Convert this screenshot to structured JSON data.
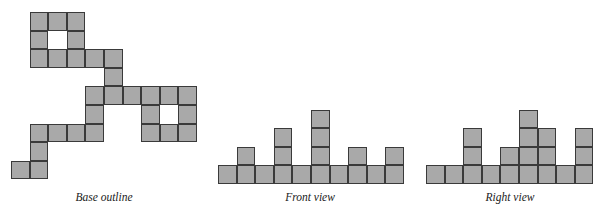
{
  "figure": {
    "cell_color": "#a9a9a9",
    "border_color": "#3a3a3a",
    "base": {
      "caption": "Base outline",
      "rows": [
        [
          1,
          2,
          3
        ],
        [
          1,
          3
        ],
        [
          1,
          2,
          3,
          4,
          5
        ],
        [
          5
        ],
        [
          4,
          5,
          6,
          7,
          8,
          9
        ],
        [
          4,
          7,
          9
        ],
        [
          1,
          2,
          3,
          4,
          7,
          8,
          9
        ],
        [
          1
        ],
        [
          0,
          1
        ]
      ]
    },
    "front": {
      "caption": "Front view",
      "heights": [
        1,
        2,
        1,
        3,
        1,
        4,
        1,
        2,
        1,
        2
      ]
    },
    "right": {
      "caption": "Right view",
      "heights": [
        1,
        1,
        3,
        1,
        2,
        4,
        3,
        1,
        3
      ]
    }
  }
}
